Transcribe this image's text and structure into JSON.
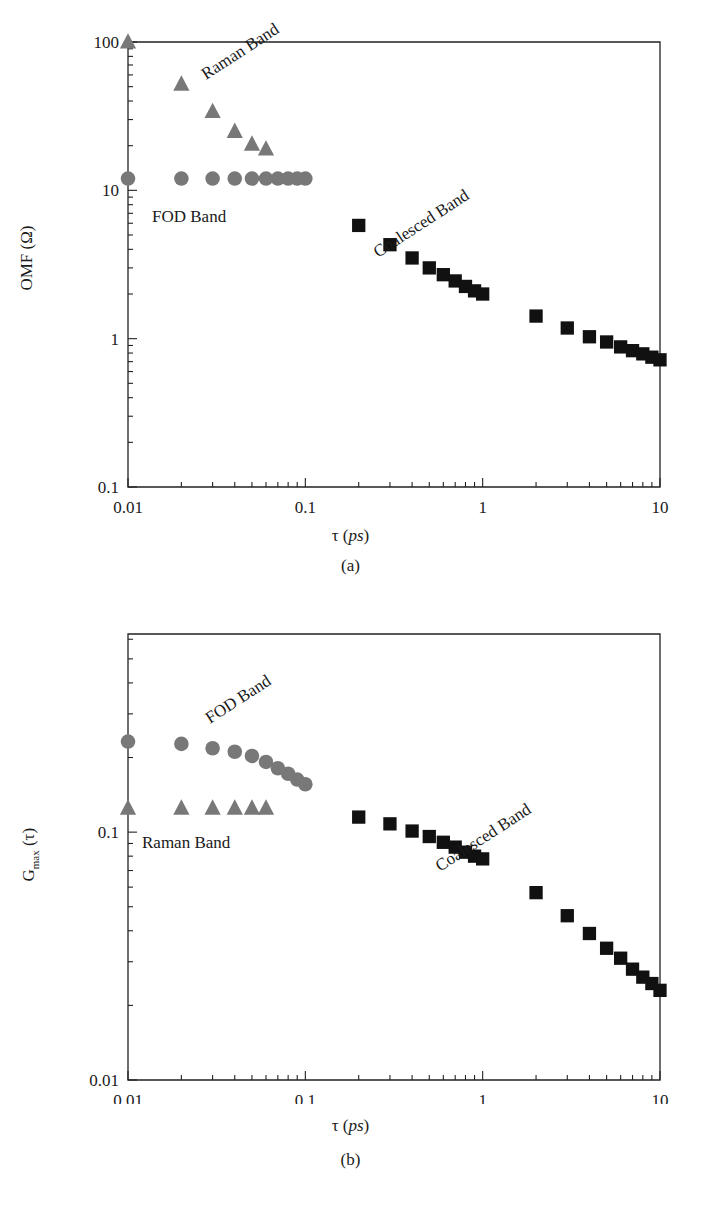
{
  "figure": {
    "panels": [
      {
        "id": "a",
        "caption": "(a)",
        "xlabel_main": "τ (",
        "xlabel_italic": "ps",
        "xlabel_close": ")",
        "ylabel": "OMF (Ω)",
        "xticks": [
          "0.01",
          "0.1",
          "1",
          "10"
        ],
        "yticks": [
          "0.1",
          "1",
          "10",
          "100"
        ],
        "annotations": [
          {
            "text": "Raman Band",
            "rotation": -33
          },
          {
            "text": "FOD Band",
            "rotation": 0
          },
          {
            "text": "Coalesced Band",
            "rotation": -33
          }
        ]
      },
      {
        "id": "b",
        "caption": "(b)",
        "xlabel_main": "τ (",
        "xlabel_italic": "ps",
        "xlabel_close": ")",
        "ylabel_main": "G",
        "ylabel_sub": "max",
        "ylabel_tail": " (τ)",
        "xticks": [
          "0.01",
          "0.1",
          "1",
          "10"
        ],
        "yticks": [
          "0.01",
          "0.1"
        ],
        "annotations": [
          {
            "text": "FOD Band",
            "rotation": -33
          },
          {
            "text": "Raman Band",
            "rotation": 0
          },
          {
            "text": "Coalesced Band",
            "rotation": -33
          }
        ]
      }
    ],
    "colors": {
      "gray_marker": "#787878",
      "black_marker": "#111111",
      "axis": "#222222",
      "background": "#ffffff"
    }
  },
  "chart_data": [
    {
      "type": "scatter",
      "panel": "a",
      "title": "",
      "xlabel": "τ (ps)",
      "ylabel": "OMF (Ω)",
      "xscale": "log",
      "yscale": "log",
      "xlim": [
        0.01,
        10
      ],
      "ylim": [
        0.1,
        100
      ],
      "grid": false,
      "legend": "inline-annotations",
      "series": [
        {
          "name": "Raman Band",
          "marker": "triangle",
          "color": "#787878",
          "x": [
            0.01,
            0.02,
            0.03,
            0.04,
            0.05,
            0.06
          ],
          "y": [
            100,
            52,
            34,
            25,
            20.5,
            19
          ]
        },
        {
          "name": "FOD Band",
          "marker": "circle",
          "color": "#787878",
          "x": [
            0.01,
            0.02,
            0.03,
            0.04,
            0.05,
            0.06,
            0.07,
            0.08,
            0.09,
            0.1
          ],
          "y": [
            12,
            12,
            12,
            12,
            12,
            12,
            12,
            12,
            12,
            12
          ]
        },
        {
          "name": "Coalesced Band",
          "marker": "square",
          "color": "#111111",
          "x": [
            0.2,
            0.3,
            0.4,
            0.5,
            0.6,
            0.7,
            0.8,
            0.9,
            1.0,
            2.0,
            3.0,
            4.0,
            5.0,
            6.0,
            7.0,
            8.0,
            9.0,
            10.0
          ],
          "y": [
            5.8,
            4.3,
            3.5,
            3.0,
            2.7,
            2.45,
            2.25,
            2.1,
            2.0,
            1.42,
            1.18,
            1.03,
            0.95,
            0.88,
            0.83,
            0.79,
            0.75,
            0.72
          ]
        }
      ]
    },
    {
      "type": "scatter",
      "panel": "b",
      "title": "",
      "xlabel": "τ (ps)",
      "ylabel": "Gmax (τ)",
      "xscale": "log",
      "yscale": "log",
      "xlim": [
        0.01,
        10
      ],
      "ylim": [
        0.01,
        0.63
      ],
      "grid": false,
      "legend": "inline-annotations",
      "series": [
        {
          "name": "FOD Band",
          "marker": "circle",
          "color": "#787878",
          "x": [
            0.01,
            0.02,
            0.03,
            0.04,
            0.05,
            0.06,
            0.07,
            0.08,
            0.09,
            0.1
          ],
          "y": [
            0.232,
            0.227,
            0.218,
            0.211,
            0.203,
            0.192,
            0.181,
            0.172,
            0.163,
            0.156
          ]
        },
        {
          "name": "Raman Band",
          "marker": "triangle",
          "color": "#787878",
          "x": [
            0.01,
            0.02,
            0.03,
            0.04,
            0.05,
            0.06
          ],
          "y": [
            0.125,
            0.125,
            0.125,
            0.125,
            0.125,
            0.125
          ]
        },
        {
          "name": "Coalesced Band",
          "marker": "square",
          "color": "#111111",
          "x": [
            0.2,
            0.3,
            0.4,
            0.5,
            0.6,
            0.7,
            0.8,
            0.9,
            1.0,
            2.0,
            3.0,
            4.0,
            5.0,
            6.0,
            7.0,
            8.0,
            9.0,
            10.0
          ],
          "y": [
            0.115,
            0.108,
            0.101,
            0.096,
            0.091,
            0.087,
            0.083,
            0.08,
            0.078,
            0.057,
            0.046,
            0.039,
            0.034,
            0.031,
            0.028,
            0.026,
            0.0245,
            0.023
          ]
        }
      ]
    }
  ]
}
